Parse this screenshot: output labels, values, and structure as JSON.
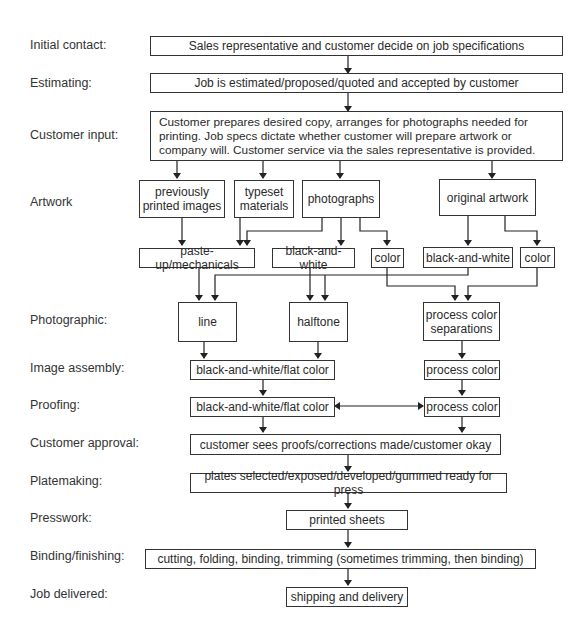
{
  "stages": [
    {
      "label": "Initial contact:"
    },
    {
      "label": "Estimating:"
    },
    {
      "label": "Customer input:"
    },
    {
      "label": "Artwork"
    },
    {
      "label": "Photographic:"
    },
    {
      "label": "Image assembly:"
    },
    {
      "label": "Proofing:"
    },
    {
      "label": "Customer approval:"
    },
    {
      "label": "Platemaking:"
    },
    {
      "label": "Presswork:"
    },
    {
      "label": "Binding/finishing:"
    },
    {
      "label": "Job delivered:"
    }
  ],
  "nodes": {
    "initial_contact": "Sales representative and customer decide on job specifications",
    "estimating": "Job is estimated/proposed/quoted and accepted by customer",
    "customer_input": "Customer prepares desired copy, arranges for photographs needed for printing. Job specs dictate whether customer will prepare artwork or company will. Customer service via the sales representative is provided.",
    "previously_printed": "previously printed images",
    "typeset": "typeset materials",
    "photographs": "photographs",
    "original_artwork": "original artwork",
    "paste_up": "paste-up/mechanicals",
    "photo_bw": "black-and-white",
    "photo_color": "color",
    "art_bw": "black-and-white",
    "art_color": "color",
    "line": "line",
    "halftone": "halftone",
    "process_sep": "process color separations",
    "assembly_bw": "black-and-white/flat color",
    "assembly_process": "process color",
    "proof_bw": "black-and-white/flat color",
    "proof_process": "process color",
    "approval": "customer sees proofs/corrections made/customer okay",
    "platemaking": "plates selected/exposed/developed/gummed ready for press",
    "presswork": "printed sheets",
    "binding": "cutting, folding, binding, trimming (sometimes trimming, then binding)",
    "delivered": "shipping and delivery"
  }
}
